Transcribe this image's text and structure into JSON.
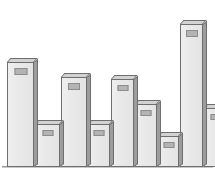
{
  "chart_data": {
    "type": "bar",
    "title": "",
    "subtitle": "",
    "xlabel": "",
    "ylabel": "",
    "grid": false,
    "legend": null,
    "axis_visible": "baseline-only",
    "categories": [
      "1",
      "2",
      "3",
      "4",
      "5",
      "6",
      "7",
      "8",
      "9",
      "10"
    ],
    "values": [
      73,
      30,
      63,
      30,
      62,
      44,
      22,
      100,
      41,
      8
    ],
    "ylim": [
      0,
      100
    ],
    "tick_labels": [],
    "annotations": [
      {
        "bar": 1,
        "text": "",
        "type": "label-patch"
      },
      {
        "bar": 2,
        "text": "",
        "type": "label-patch"
      },
      {
        "bar": 3,
        "text": "",
        "type": "label-patch"
      },
      {
        "bar": 4,
        "text": "",
        "type": "label-patch"
      },
      {
        "bar": 5,
        "text": "",
        "type": "label-patch"
      },
      {
        "bar": 6,
        "text": "",
        "type": "label-patch"
      },
      {
        "bar": 7,
        "text": "",
        "type": "label-patch"
      },
      {
        "bar": 8,
        "text": "",
        "type": "label-patch"
      },
      {
        "bar": 9,
        "text": "",
        "type": "label-patch"
      }
    ]
  },
  "style": {
    "bar_face": "#e9e9e9",
    "bar_side": "#9d9d9d",
    "bar_top": "#d2d2d2",
    "bar_outline": "#6e6e6e",
    "label_patch": "#b4b4b4",
    "baseline": "#9a9a9a",
    "background": "#ffffff"
  },
  "bars": [
    {
      "name": "bar-1",
      "left": 7,
      "width": 27,
      "height": 105,
      "label": "",
      "label_w": 13,
      "label_h": 7,
      "label_top": 5
    },
    {
      "name": "bar-2",
      "left": 35,
      "width": 25,
      "height": 43,
      "label": "",
      "label_w": 11,
      "label_h": 6,
      "label_top": 5
    },
    {
      "name": "bar-3",
      "left": 61,
      "width": 26,
      "height": 90,
      "label": "",
      "label_w": 12,
      "label_h": 7,
      "label_top": 5
    },
    {
      "name": "bar-4",
      "left": 88,
      "width": 22,
      "height": 43,
      "label": "",
      "label_w": 11,
      "label_h": 6,
      "label_top": 5
    },
    {
      "name": "bar-5",
      "left": 111,
      "width": 23,
      "height": 88,
      "label": "",
      "label_w": 11,
      "label_h": 6,
      "label_top": 5
    },
    {
      "name": "bar-6",
      "left": 135,
      "width": 22,
      "height": 63,
      "label": "",
      "label_w": 11,
      "label_h": 6,
      "label_top": 5
    },
    {
      "name": "bar-7",
      "left": 158,
      "width": 21,
      "height": 31,
      "label": "",
      "label_w": 11,
      "label_h": 6,
      "label_top": 5
    },
    {
      "name": "bar-8",
      "left": 180,
      "width": 23,
      "height": 143,
      "label": "",
      "label_w": 12,
      "label_h": 7,
      "label_top": 5
    },
    {
      "name": "bar-9",
      "left": 204,
      "width": 23,
      "height": 59,
      "label": "",
      "label_w": 11,
      "label_h": 6,
      "label_top": 5
    }
  ]
}
